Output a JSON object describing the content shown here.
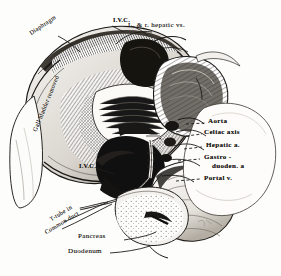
{
  "figure": {
    "medium": "pen-and-ink / wash anatomical illustration",
    "background_color": "#fdfdfc",
    "ink_color": "#1a1816",
    "width": 281,
    "height": 276
  },
  "labels": {
    "diaphragm": "Diaphragm",
    "ivc_top": "I.V.C.",
    "hepatic_veins": "L. & r. hepatic vs.",
    "gall_bladder": "Gall bladder removed",
    "ivc_mid": "I.V.C.",
    "aorta": "Aorta",
    "celiac_axis": "Celiac axis",
    "hepatic_artery": "Hepatic a.",
    "gastroduodenal_line1": "Gastro -",
    "gastroduodenal_line2": "duoden. a",
    "portal_vein": "Portal v.",
    "ttube_line1": "T-tube in",
    "ttube_line2": "Common duct",
    "pancreas": "Pancreas",
    "duodenum": "Duodenum"
  }
}
